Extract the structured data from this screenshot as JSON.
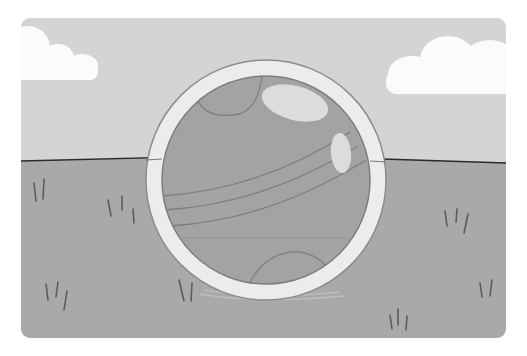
{
  "scene": {
    "description": "Grayscale illustration of a ball inside a circular ring frame on grassy ground under a cloudy sky",
    "colors": {
      "background": "#ffffff",
      "sky": "#d4d4d4",
      "cloud": "#fbfbfb",
      "ground": "#a9a9a9",
      "horizon": "#2a2a2a",
      "ring": "#ececec",
      "ring_edge": "#8c8c8c",
      "ball": "#a3a3a3",
      "ball_line": "#7e7e7e",
      "highlight": "#dcdcdc",
      "grass": "#5c5c5c"
    }
  }
}
